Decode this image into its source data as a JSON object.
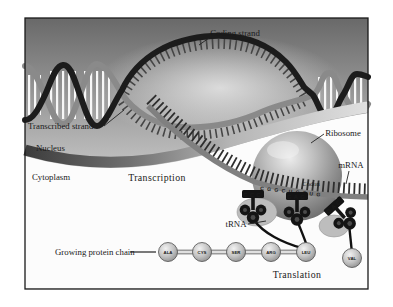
{
  "figure": {
    "labels": {
      "coding_strand": "Coding strand",
      "transcribed_strand": "Transcribed strand",
      "nucleus": "Nucleus",
      "cytoplasm": "Cytoplasm",
      "transcription": "Transcription",
      "ribosome": "Ribosome",
      "mrna": "mRNA",
      "codon": "Codon",
      "trna": "tRNA",
      "growing_protein_chain": "Growing protein chain",
      "translation": "Translation"
    },
    "protein_chain": [
      "ALA",
      "CYS",
      "SER",
      "ARG",
      "LEU"
    ],
    "incoming_amino_acid": "VAL",
    "anticodons": [
      "GCC",
      "GAG",
      "GAC"
    ],
    "mrna_bases": "CGGCUCCUG",
    "colors": {
      "nucleus_top": "#6b6b6b",
      "nucleus_bottom": "#e4e4e4",
      "cytoplasm": "#fcfcfc",
      "coding_strand": "#1c1c1c",
      "transcribed_strand": "#8a8a8a",
      "mrna_strand": "#808080",
      "trna_body": "#141414",
      "ribosome": "#8f8f8f"
    }
  }
}
